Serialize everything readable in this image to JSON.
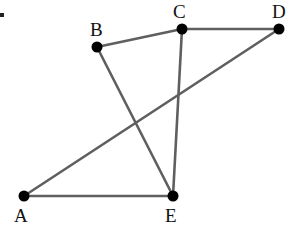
{
  "diagram": {
    "type": "graph",
    "background": "#ffffff",
    "edge_color": "#5f5f5f",
    "vertex_color": "#000000",
    "artifact": {
      "x": 2,
      "y": 15
    },
    "vertices": [
      {
        "id": "A",
        "label": "A",
        "x": 24,
        "y": 196,
        "label_x": 14,
        "label_y": 222
      },
      {
        "id": "B",
        "label": "B",
        "x": 97,
        "y": 47,
        "label_x": 90,
        "label_y": 36
      },
      {
        "id": "C",
        "label": "C",
        "x": 182,
        "y": 29,
        "label_x": 173,
        "label_y": 18
      },
      {
        "id": "D",
        "label": "D",
        "x": 279,
        "y": 29,
        "label_x": 272,
        "label_y": 18
      },
      {
        "id": "E",
        "label": "E",
        "x": 173,
        "y": 196,
        "label_x": 165,
        "label_y": 222
      }
    ],
    "edges": [
      {
        "from": "B",
        "to": "C"
      },
      {
        "from": "C",
        "to": "D"
      },
      {
        "from": "C",
        "to": "E"
      },
      {
        "from": "B",
        "to": "E"
      },
      {
        "from": "A",
        "to": "E"
      },
      {
        "from": "A",
        "to": "D"
      }
    ]
  }
}
